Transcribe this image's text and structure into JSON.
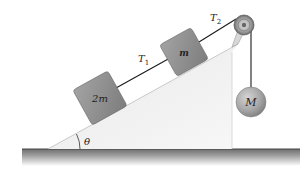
{
  "diagram": {
    "type": "physics-incline-pulley",
    "incline": {
      "angle_label": "θ"
    },
    "blocks": [
      {
        "id": "block-2m",
        "label": "2m",
        "mass_var": "m",
        "coefficient": "2"
      },
      {
        "id": "block-m",
        "label": "m",
        "mass_var": "m"
      }
    ],
    "hanging_mass": {
      "label": "M"
    },
    "tensions": [
      {
        "label_main": "T",
        "label_sub": "1"
      },
      {
        "label_main": "T",
        "label_sub": "2"
      }
    ],
    "colors": {
      "block_fill": "#8c8c8c",
      "incline_fill": "#f2f2f2",
      "ground": "#7a7a7a",
      "rope": "#1a1a1a",
      "ball": "#a6a6a6"
    }
  }
}
